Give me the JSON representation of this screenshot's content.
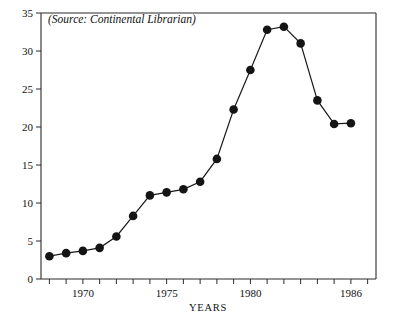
{
  "chart_data": {
    "type": "line",
    "title": "",
    "subtitle": "",
    "annotation": "(Source: Continental Librarian)",
    "xlabel": "YEARS",
    "ylabel": "DOLLARS (BILLIONS)",
    "xlim": [
      1967.5,
      1987.5
    ],
    "ylim": [
      0,
      35
    ],
    "grid": false,
    "legend": null,
    "y_ticks": [
      0,
      5,
      10,
      15,
      20,
      25,
      30,
      35
    ],
    "y_tick_labels": [
      "0",
      "5",
      "10",
      "15",
      "20",
      "25",
      "30",
      "35"
    ],
    "x_ticks": [
      1968,
      1969,
      1970,
      1971,
      1972,
      1973,
      1974,
      1975,
      1976,
      1977,
      1978,
      1979,
      1980,
      1981,
      1982,
      1983,
      1984,
      1985,
      1986,
      1987
    ],
    "x_tick_labels": [
      "1970",
      "1975",
      "1980",
      "1986"
    ],
    "x_labeled_ticks": [
      1970,
      1975,
      1980,
      1986
    ],
    "x": [
      1968,
      1969,
      1970,
      1971,
      1972,
      1973,
      1974,
      1975,
      1976,
      1977,
      1978,
      1979,
      1980,
      1981,
      1982,
      1983,
      1984,
      1985,
      1986
    ],
    "values": [
      3.0,
      3.4,
      3.7,
      4.1,
      5.6,
      8.3,
      11.0,
      11.4,
      11.8,
      12.8,
      15.8,
      22.3,
      27.5,
      32.8,
      33.2,
      31.0,
      23.5,
      20.4,
      20.5
    ],
    "series": [
      {
        "name": "Dollars (Billions)",
        "marker": "filled-circle",
        "color": "#141414",
        "values": [
          3.0,
          3.4,
          3.7,
          4.1,
          5.6,
          8.3,
          11.0,
          11.4,
          11.8,
          12.8,
          15.8,
          22.3,
          27.5,
          32.8,
          33.2,
          31.0,
          23.5,
          20.4,
          20.5
        ]
      }
    ]
  },
  "colors": {
    "line": "#1a1a1a",
    "marker": "#141414",
    "axis": "#2a2a2a",
    "background": "#ffffff"
  }
}
